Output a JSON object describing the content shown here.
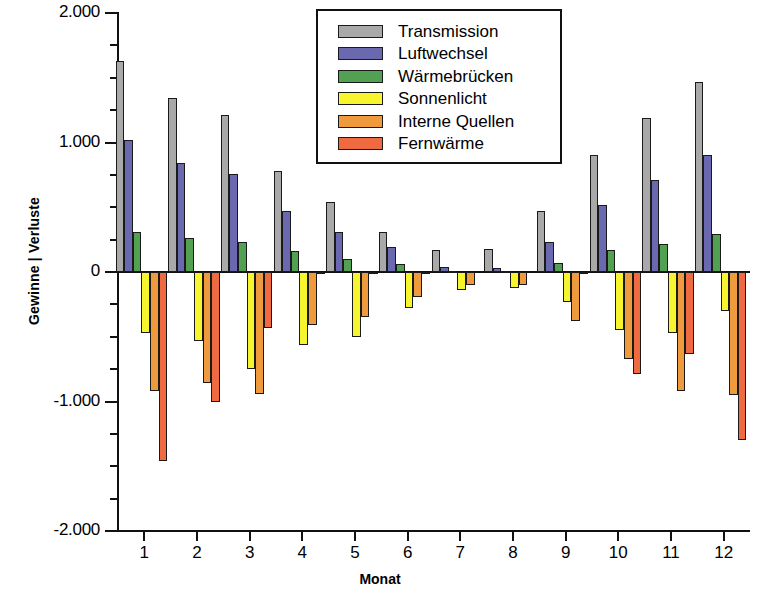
{
  "chart_data": {
    "type": "bar",
    "title": "",
    "xlabel": "Monat",
    "ylabel": "Gewinne | Verluste",
    "categories": [
      "1",
      "2",
      "3",
      "4",
      "5",
      "6",
      "7",
      "8",
      "9",
      "10",
      "11",
      "12"
    ],
    "ylim": [
      -2.0,
      2.0
    ],
    "ytick_labels": [
      "2.000",
      "1.000",
      "0",
      "-1.000",
      "-2.000"
    ],
    "ytick_values": [
      2.0,
      1.0,
      0.0,
      -1.0,
      -2.0
    ],
    "yminor_step": 0.25,
    "grid": false,
    "legend_position": "top-center",
    "series": [
      {
        "name": "Transmission",
        "color": "#a9a9a9",
        "values": [
          1.63,
          1.34,
          1.21,
          0.78,
          0.54,
          0.31,
          0.17,
          0.18,
          0.47,
          0.9,
          1.19,
          1.47
        ]
      },
      {
        "name": "Luftwechsel",
        "color": "#6a68ae",
        "values": [
          1.02,
          0.84,
          0.76,
          0.47,
          0.31,
          0.19,
          0.04,
          0.03,
          0.23,
          0.52,
          0.71,
          0.9
        ]
      },
      {
        "name": "Wärmebrücken",
        "color": "#52a153",
        "values": [
          0.31,
          0.26,
          0.23,
          0.16,
          0.1,
          0.06,
          0.01,
          0.01,
          0.07,
          0.17,
          0.22,
          0.29
        ]
      },
      {
        "name": "Sonnenlicht",
        "color": "#f7f62e",
        "values": [
          -0.47,
          -0.53,
          -0.75,
          -0.56,
          -0.5,
          -0.28,
          -0.14,
          -0.12,
          -0.23,
          -0.45,
          -0.47,
          -0.3
        ]
      },
      {
        "name": "Interne Quellen",
        "color": "#f09a3e",
        "values": [
          -0.92,
          -0.86,
          -0.94,
          -0.41,
          -0.35,
          -0.19,
          -0.1,
          -0.1,
          -0.38,
          -0.67,
          -0.92,
          -0.95
        ]
      },
      {
        "name": "Fernwärme",
        "color": "#ef6a40",
        "values": [
          -1.46,
          -1.0,
          -0.43,
          -0.01,
          -0.01,
          -0.01,
          0.0,
          0.0,
          -0.01,
          -0.79,
          -0.63,
          -1.3
        ]
      }
    ]
  },
  "legend": {
    "items": [
      {
        "label": "Transmission",
        "color": "#a9a9a9"
      },
      {
        "label": "Luftwechsel",
        "color": "#6a68ae"
      },
      {
        "label": "Wärmebrücken",
        "color": "#52a153"
      },
      {
        "label": "Sonnenlicht",
        "color": "#f7f62e"
      },
      {
        "label": "Interne Quellen",
        "color": "#f09a3e"
      },
      {
        "label": "Fernwärme",
        "color": "#ef6a40"
      }
    ]
  },
  "axes": {
    "y_title": "Gewinne | Verluste",
    "x_title": "Monat"
  }
}
